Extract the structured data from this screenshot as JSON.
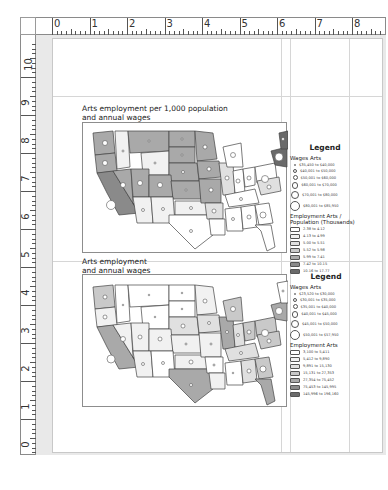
{
  "rulers": {
    "horizontal_labels": [
      "0",
      "1",
      "2",
      "3",
      "4",
      "5",
      "6",
      "7",
      "8"
    ],
    "vertical_labels": [
      "10",
      "9",
      "8",
      "7",
      "6",
      "5",
      "4",
      "3",
      "2",
      "1",
      "0"
    ]
  },
  "maps": [
    {
      "title_line1": "Arts employment per 1,000 population",
      "title_line2": "and annual wages",
      "legend": {
        "title": "Legend",
        "wages_label": "Wages Arts",
        "wages_classes": [
          "$35,450 to $40,000",
          "$40,001 to $50,000",
          "$50,001 to $60,000",
          "$60,001 to $70,000",
          "$70,001 to $80,000",
          "$80,001 to $85,950"
        ],
        "employment_label": "Employment Arts / Population (Thousands)",
        "employment_classes": [
          "2.38 to 4.12",
          "4.13 to 4.99",
          "5.00 to 5.51",
          "5.52 to 5.98",
          "5.99 to 7.41",
          "7.42 to 10.15",
          "10.16 to 17.77"
        ]
      }
    },
    {
      "title_line1": "Arts employment",
      "title_line2": "and annual wages",
      "legend": {
        "title": "Legend",
        "wages_label": "Wages Arts",
        "wages_classes": [
          "$23,520 to $30,000",
          "$30,001 to $35,000",
          "$35,001 to $40,000",
          "$40,001 to $45,000",
          "$45,001 to $50,000",
          "$50,001 to $57,950"
        ],
        "employment_label": "Employment Arts",
        "employment_classes": [
          "3,100 to 5,411",
          "5,412 to 9,890",
          "9,891 to 15,130",
          "15,131 to 27,353",
          "27,354 to 75,452",
          "75,453 to 145,995",
          "145,996 to 196,160"
        ]
      }
    }
  ],
  "colors": {
    "shade": [
      "#ffffff",
      "#f1f1f1",
      "#e0e0e0",
      "#c9c9c9",
      "#a9a9a9",
      "#8a8a8a",
      "#6a6a6a"
    ]
  }
}
